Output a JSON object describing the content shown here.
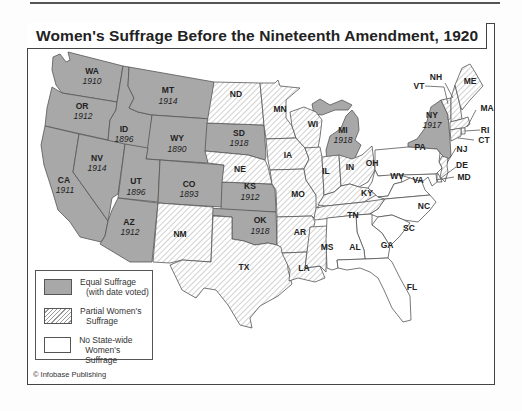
{
  "title": "Women's Suffrage Before the Nineteenth Amendment, 1920",
  "colors": {
    "equal_suffrage": "#a8a8a8",
    "partial_suffrage_hatch": "#999999",
    "no_suffrage": "#ffffff",
    "border": "#555555"
  },
  "legend": {
    "items": [
      {
        "key": "equal",
        "line1": "Equal Suffrage",
        "line2": "(with date voted)"
      },
      {
        "key": "partial",
        "line1": "Partial Women's",
        "line2": "Suffrage"
      },
      {
        "key": "none",
        "line1": "No State-wide",
        "line2": "Women's Suffrage"
      }
    ]
  },
  "credit": "© Infobase Publishing",
  "states": {
    "WA": {
      "label": "WA",
      "status": "equal",
      "year": "1910"
    },
    "OR": {
      "label": "OR",
      "status": "equal",
      "year": "1912"
    },
    "CA": {
      "label": "CA",
      "status": "equal",
      "year": "1911"
    },
    "ID": {
      "label": "ID",
      "status": "equal",
      "year": "1896"
    },
    "NV": {
      "label": "NV",
      "status": "equal",
      "year": "1914"
    },
    "MT": {
      "label": "MT",
      "status": "equal",
      "year": "1914"
    },
    "WY": {
      "label": "WY",
      "status": "equal",
      "year": "1890"
    },
    "UT": {
      "label": "UT",
      "status": "equal",
      "year": "1896"
    },
    "CO": {
      "label": "CO",
      "status": "equal",
      "year": "1893"
    },
    "AZ": {
      "label": "AZ",
      "status": "equal",
      "year": "1912"
    },
    "SD": {
      "label": "SD",
      "status": "equal",
      "year": "1918"
    },
    "KS": {
      "label": "KS",
      "status": "equal",
      "year": "1912"
    },
    "OK": {
      "label": "OK",
      "status": "equal",
      "year": "1918"
    },
    "MI": {
      "label": "MI",
      "status": "equal",
      "year": "1918"
    },
    "NY": {
      "label": "NY",
      "status": "equal",
      "year": "1917"
    },
    "NM": {
      "label": "NM",
      "status": "partial"
    },
    "TX": {
      "label": "TX",
      "status": "partial"
    },
    "ND": {
      "label": "ND",
      "status": "partial"
    },
    "NE": {
      "label": "NE",
      "status": "partial"
    },
    "MN": {
      "label": "MN",
      "status": "partial"
    },
    "IA": {
      "label": "IA",
      "status": "partial"
    },
    "MO": {
      "label": "MO",
      "status": "partial"
    },
    "AR": {
      "label": "AR",
      "status": "partial"
    },
    "LA": {
      "label": "LA",
      "status": "partial"
    },
    "WI": {
      "label": "WI",
      "status": "partial"
    },
    "IL": {
      "label": "IL",
      "status": "partial"
    },
    "IN": {
      "label": "IN",
      "status": "partial"
    },
    "OH": {
      "label": "OH",
      "status": "partial"
    },
    "KY": {
      "label": "KY",
      "status": "partial"
    },
    "TN": {
      "label": "TN",
      "status": "partial"
    },
    "MS": {
      "label": "MS",
      "status": "partial"
    },
    "VT": {
      "label": "VT",
      "status": "partial"
    },
    "NH": {
      "label": "NH",
      "status": "partial"
    },
    "ME": {
      "label": "ME",
      "status": "partial"
    },
    "MA": {
      "label": "MA",
      "status": "partial"
    },
    "RI": {
      "label": "RI",
      "status": "partial"
    },
    "CT": {
      "label": "CT",
      "status": "partial"
    },
    "NJ": {
      "label": "NJ",
      "status": "partial"
    },
    "DE": {
      "label": "DE",
      "status": "partial"
    },
    "PA": {
      "label": "PA",
      "status": "none"
    },
    "WV": {
      "label": "WV",
      "status": "none"
    },
    "VA": {
      "label": "VA",
      "status": "none"
    },
    "MD": {
      "label": "MD",
      "status": "none"
    },
    "NC": {
      "label": "NC",
      "status": "none"
    },
    "SC": {
      "label": "SC",
      "status": "none"
    },
    "GA": {
      "label": "GA",
      "status": "none"
    },
    "AL": {
      "label": "AL",
      "status": "none"
    },
    "FL": {
      "label": "FL",
      "status": "none"
    }
  }
}
